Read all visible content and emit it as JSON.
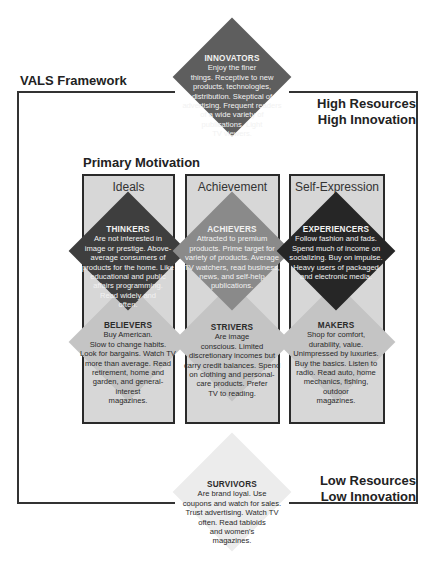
{
  "title": "VALS  Framework",
  "primary_motivation": "Primary Motivation",
  "corners": {
    "top_right": [
      "High Resources",
      "High Innovation"
    ],
    "bottom_right": [
      "Low Resources",
      "Low Innovation"
    ]
  },
  "columns": [
    {
      "label": "Ideals"
    },
    {
      "label": "Achievement"
    },
    {
      "label": "Self-Expression"
    }
  ],
  "segments": {
    "innovators": {
      "name": "INNOVATORS",
      "lines": [
        "Enjoy the  finer",
        "things.  Receptive to new",
        "products, technologies,",
        "distribution. Skeptical of",
        "advertising. Frequent readers",
        "of a wide variety of",
        "publications. Light",
        "TV viewers."
      ]
    },
    "thinkers": {
      "name": "THINKERS",
      "lines": [
        "Are not interested in",
        "image or prestige. Above-",
        "average consumers of",
        "products for the home. Like",
        "educational and public",
        "affairs programming.",
        "Read widely and",
        "often."
      ]
    },
    "achievers": {
      "name": "ACHIEVERS",
      "lines": [
        "Attracted to premium",
        "products. Prime target for",
        "variety of products. Average",
        "TV watchers, read business,",
        "news, and self-help",
        "publications."
      ]
    },
    "experiencers": {
      "name": "EXPERIENCERS",
      "lines": [
        "Follow fashion and fads.",
        "Spend much of income on",
        "socializing. Buy on impulse.",
        "Heavy users of packaged",
        "and electronic media."
      ]
    },
    "believers": {
      "name": "BELIEVERS",
      "lines": [
        "Buy American.",
        "Slow to change habits.",
        "Look for bargains. Watch TV",
        "more than average. Read",
        "retirement, home and",
        "garden, and general-",
        "interest",
        "magazines."
      ]
    },
    "strivers": {
      "name": "STRIVERS",
      "lines": [
        "Are image",
        "conscious. Limited",
        "discretionary incomes but",
        "carry credit balances. Spend",
        "on clothing and personal-",
        "care products. Prefer",
        "TV to reading."
      ]
    },
    "makers": {
      "name": "MAKERS",
      "lines": [
        "Shop for comfort,",
        "durability, value.",
        "Unimpressed by luxuries.",
        "Buy the basics. Listen to",
        "radio. Read auto, home",
        "mechanics, fishing,",
        "outdoor",
        "magazines."
      ]
    },
    "survivors": {
      "name": "SURVIVORS",
      "lines": [
        "Are brand loyal. Use",
        "coupons and watch for sales.",
        "Trust advertising. Watch TV",
        "often. Read tabloids",
        "and women's",
        "magazines."
      ]
    }
  },
  "colors": {
    "innovators": "#5e5e5e",
    "thinkers": "#3e3e3e",
    "achievers": "#8a8a8a",
    "experiencers": "#262626",
    "lower_diamonds": "#c4c4c4",
    "survivors": "#ececec",
    "column_bg": "#d7d7d7"
  }
}
